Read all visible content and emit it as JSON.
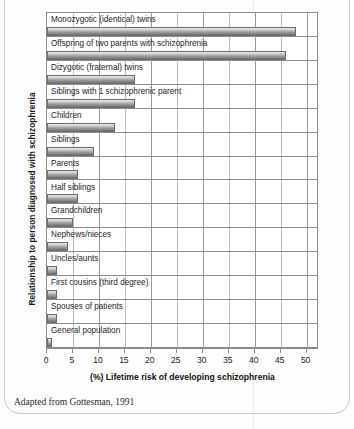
{
  "figure": {
    "top_clipped_text": "",
    "caption": "Adapted from Gottesman, 1991",
    "ylabel": "Relationship to person diagnosed with schizophrenia",
    "xlabel": "(%) Lifetime risk of developing schizophrenia"
  },
  "chart_data": {
    "type": "bar",
    "orientation": "horizontal",
    "title": "",
    "xlabel": "(%) Lifetime risk of developing schizophrenia",
    "ylabel": "Relationship to person diagnosed with schizophrenia",
    "xlim": [
      0,
      52
    ],
    "xticks": [
      0,
      5,
      10,
      15,
      20,
      25,
      30,
      35,
      40,
      45,
      50
    ],
    "grid": true,
    "legend": false,
    "source_note": "Adapted from Gottesman, 1991",
    "categories": [
      "Monozygotic (identical) twins",
      "Offspring of two parents with schizophrenia",
      "Dizygotic (fraternal) twins",
      "Siblings with 1 schizophrenic parent",
      "Children",
      "Siblings",
      "Parents",
      "Half siblings",
      "Grandchildren",
      "Nephews/nieces",
      "Uncles/aunts",
      "First cousins (third degree)",
      "Spouses of patients",
      "General population"
    ],
    "values": [
      48,
      46,
      17,
      17,
      13,
      9,
      6,
      6,
      5,
      4,
      2,
      2,
      2,
      1
    ],
    "bar_color": "#9c9c9c",
    "bar_edge_color": "#6b6b6b",
    "axis_color": "#8c8c8c"
  }
}
